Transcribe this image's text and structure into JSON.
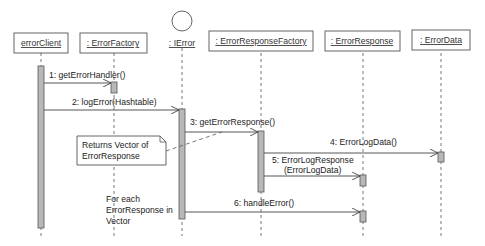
{
  "diagram": {
    "type": "uml-sequence",
    "colors": {
      "line": "#444444",
      "activation_fill": "#b8b8b8",
      "background": "#ffffff"
    },
    "participants": [
      {
        "id": "errorClient",
        "label": "errorClient",
        "kind": "object"
      },
      {
        "id": "errorFactory",
        "label": ": ErrorFactory",
        "kind": "object"
      },
      {
        "id": "ierror",
        "label": ": IError",
        "kind": "interface"
      },
      {
        "id": "errorResponseFactory",
        "label": ": ErrorResponseFactory",
        "kind": "object"
      },
      {
        "id": "errorResponse",
        "label": ": ErrorResponse",
        "kind": "object"
      },
      {
        "id": "errorData",
        "label": ": ErrorData",
        "kind": "object"
      }
    ],
    "messages": [
      {
        "num": "1",
        "label": "1: getErrorHandler()",
        "from": "errorClient",
        "to": "errorFactory"
      },
      {
        "num": "2",
        "label": "2: logError(Hashtable)",
        "from": "errorClient",
        "to": "ierror"
      },
      {
        "num": "3",
        "label": "3: getErrorResponse()",
        "from": "ierror",
        "to": "errorResponseFactory"
      },
      {
        "num": "4",
        "label": "4: ErrorLogData()",
        "from": "errorResponseFactory",
        "to": "errorData"
      },
      {
        "num": "5",
        "label_line1": "5: ErrorLogResponse",
        "label_line2": "(ErrorLogData)",
        "from": "errorResponseFactory",
        "to": "errorResponse"
      },
      {
        "num": "6",
        "label": "6: handleError()",
        "from": "ierror",
        "to": "errorResponse"
      }
    ],
    "notes": [
      {
        "line1": "Returns Vector of",
        "line2": "ErrorResponse"
      }
    ],
    "loop_text": {
      "line1": "For each",
      "line2": "ErrorResponse in",
      "line3": "Vector"
    }
  }
}
